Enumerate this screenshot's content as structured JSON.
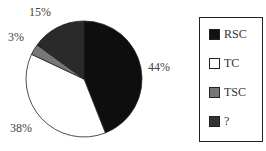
{
  "chart_data": {
    "type": "pie",
    "title": "",
    "start_angle": "12 o'clock",
    "direction": "clockwise",
    "slices": [
      {
        "label": "RSC",
        "value": 44,
        "display": "44%",
        "color": "#0e0e0e"
      },
      {
        "label": "TC",
        "value": 38,
        "display": "38%",
        "color": "#ffffff"
      },
      {
        "label": "TSC",
        "value": 3,
        "display": "3%",
        "color": "#777777"
      },
      {
        "label": "?",
        "value": 15,
        "display": "15%",
        "color": "#2a2a2a"
      }
    ],
    "legend_position": "right"
  },
  "labels": {
    "rsc": "44%",
    "tc": "38%",
    "tsc": "3%",
    "unknown": "15%"
  },
  "legend": {
    "items": [
      {
        "label": "RSC",
        "color": "#111111"
      },
      {
        "label": "TC",
        "color": "#ffffff"
      },
      {
        "label": "TSC",
        "color": "#777777"
      },
      {
        "label": "?",
        "color": "#333333"
      }
    ]
  }
}
